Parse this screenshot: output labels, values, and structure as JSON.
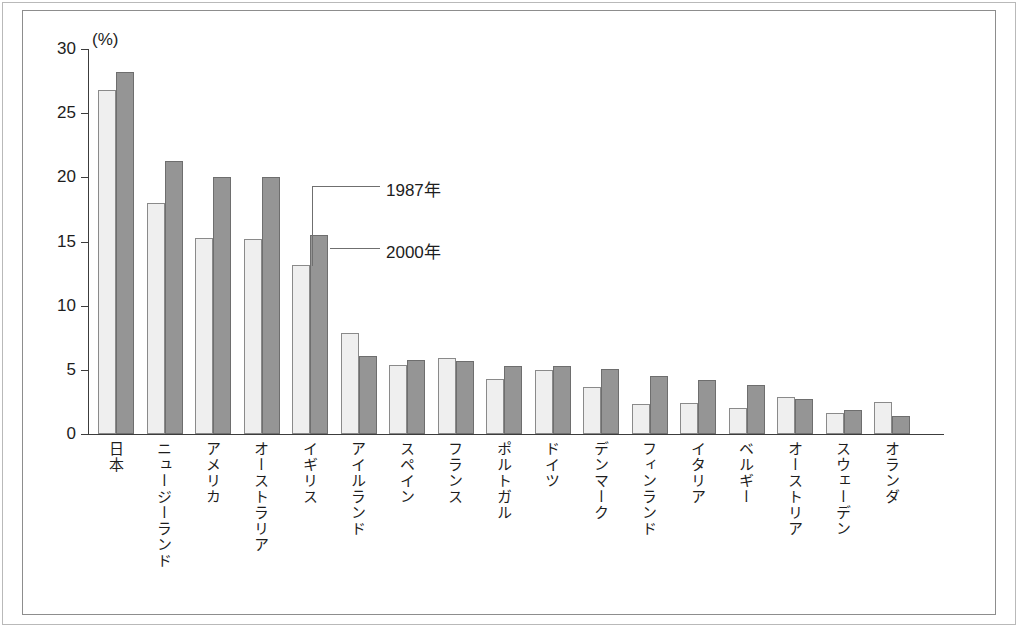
{
  "figure": {
    "unit_label": "(%)",
    "frame_color": "#8d8d8d"
  },
  "legend": {
    "series_1_label": "1987年",
    "series_2_label": "2000年",
    "series_1_color": "#efefef",
    "series_2_color": "#959595"
  },
  "axis": {
    "y_ticks": [
      "30",
      "25",
      "20",
      "15",
      "10",
      "5",
      "0"
    ]
  },
  "chart_data": {
    "type": "bar",
    "title": "",
    "xlabel": "",
    "ylabel": "(%)",
    "ylim": [
      0,
      30
    ],
    "ytick_values": [
      0,
      5,
      10,
      15,
      20,
      25,
      30
    ],
    "grid": false,
    "legend_position": "inside-plot-annotation",
    "categories": [
      "日本",
      "ニュージーランド",
      "アメリカ",
      "オーストラリア",
      "イギリス",
      "アイルランド",
      "スペイン",
      "フランス",
      "ポルトガル",
      "ドイツ",
      "デンマーク",
      "フィンランド",
      "イタリア",
      "ベルギー",
      "オーストリア",
      "スウェーデン",
      "オランダ"
    ],
    "series": [
      {
        "name": "1987年",
        "color": "#efefef",
        "values": [
          26.8,
          18.0,
          15.3,
          15.2,
          13.2,
          7.9,
          5.4,
          5.9,
          4.3,
          5.0,
          3.7,
          2.3,
          2.4,
          2.0,
          2.9,
          1.6,
          2.5
        ]
      },
      {
        "name": "2000年",
        "color": "#959595",
        "values": [
          28.2,
          21.3,
          20.0,
          20.0,
          15.5,
          6.1,
          5.8,
          5.7,
          5.3,
          5.3,
          5.1,
          4.5,
          4.2,
          3.8,
          2.7,
          1.9,
          1.4
        ]
      }
    ]
  }
}
